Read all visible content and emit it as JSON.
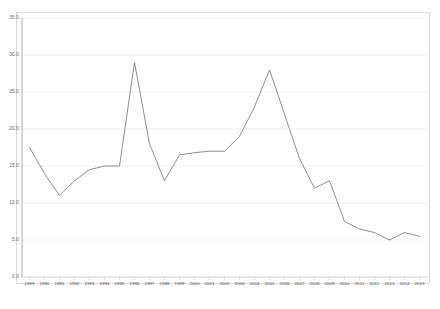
{
  "chart_data": {
    "type": "line",
    "title": "",
    "subtitle": "",
    "xlabel": "",
    "ylabel": "",
    "categories": [
      "1989",
      "1990",
      "1991",
      "1992",
      "1993",
      "1994",
      "1995",
      "1996",
      "1997",
      "1998",
      "1999",
      "2000",
      "2001",
      "2002",
      "2003",
      "2004",
      "2005",
      "2006",
      "2007",
      "2008",
      "2009",
      "2010",
      "2011",
      "2012",
      "2013",
      "2014",
      "2015"
    ],
    "values": [
      17.5,
      14.0,
      11.0,
      13.0,
      14.5,
      15.0,
      15.0,
      29.0,
      18.0,
      13.0,
      16.5,
      16.8,
      17.0,
      17.0,
      19.0,
      23.0,
      28.0,
      22.0,
      16.0,
      12.0,
      13.0,
      7.5,
      6.5,
      6.0,
      5.0,
      6.0,
      5.5
    ],
    "series": [
      {
        "name": "series-1",
        "values": [
          17.5,
          14.0,
          11.0,
          13.0,
          14.5,
          15.0,
          15.0,
          29.0,
          18.0,
          13.0,
          16.5,
          16.8,
          17.0,
          17.0,
          19.0,
          23.0,
          28.0,
          22.0,
          16.0,
          12.0,
          13.0,
          7.5,
          6.5,
          6.0,
          5.0,
          6.0,
          5.5
        ],
        "color": "#808080"
      }
    ],
    "ylim": [
      0.0,
      35.0
    ],
    "yticks": [
      0.0,
      5.0,
      10.0,
      15.0,
      20.0,
      25.0,
      30.0,
      35.0
    ],
    "ytick_labels": [
      "0.0",
      "5.0",
      "10.0",
      "15.0",
      "20.0",
      "25.0",
      "30.0",
      "35.0"
    ],
    "grid": true,
    "grid_color": "#e8e8e8",
    "legend": false,
    "legend_position": "none",
    "line_color": "#808080",
    "frame_color": "#d9d9d9",
    "background": "#ffffff",
    "markers": false,
    "annotations": []
  }
}
